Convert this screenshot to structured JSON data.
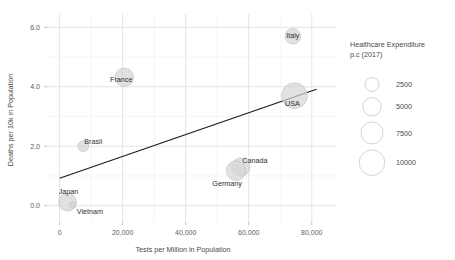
{
  "chart_data": {
    "type": "scatter",
    "title": "",
    "xlabel": "Tests per Million in Population",
    "ylabel": "Deaths per 10k in Population",
    "xlim": [
      -4000,
      88000
    ],
    "ylim": [
      -0.55,
      6.45
    ],
    "xticks": [
      0,
      20000,
      40000,
      60000,
      80000
    ],
    "xticklabels": [
      "0",
      "20,000",
      "40,000",
      "60,000",
      "80,000"
    ],
    "yticks": [
      0.0,
      2.0,
      4.0,
      6.0
    ],
    "yticklabels": [
      "0.0",
      "2.0",
      "4.0",
      "6.0"
    ],
    "grid": true,
    "grid_minor": true,
    "size_variable": "Healthcare Expenditure p.c (2017)",
    "points": [
      {
        "label": "Italy",
        "x": 74000,
        "y": 5.7,
        "size": 3400,
        "label_dx": 0,
        "label_dy": -0.5
      },
      {
        "label": "USA",
        "x": 74500,
        "y": 3.7,
        "size": 10200,
        "label_dx": -2,
        "label_dy": 7.5
      },
      {
        "label": "France",
        "x": 20500,
        "y": 4.32,
        "size": 5100,
        "label_dx": -3,
        "label_dy": 2.0
      },
      {
        "label": "Brasil",
        "x": 7500,
        "y": 2.0,
        "size": 1500,
        "label_dx": 10,
        "label_dy": -5.0
      },
      {
        "label": "Canada",
        "x": 57500,
        "y": 1.3,
        "size": 5000,
        "label_dx": 14,
        "label_dy": -6.0
      },
      {
        "label": "Germany",
        "x": 56000,
        "y": 1.18,
        "size": 5900,
        "label_dx": -9,
        "label_dy": 13.0
      },
      {
        "label": "Japan",
        "x": 2500,
        "y": 0.12,
        "size": 4700,
        "label_dx": 1,
        "label_dy": -10.0
      },
      {
        "label": "Vietnam",
        "x": 4200,
        "y": 0.02,
        "size": 500,
        "label_dx": 17,
        "label_dy": 7.0
      }
    ],
    "trendline": {
      "x_start": 0,
      "y_start": 0.92,
      "x_end": 81500,
      "y_end": 3.92
    },
    "legend": {
      "title_line1": "Healthcare Expenditure",
      "title_line2": "p.c (2017)",
      "position": "right",
      "entries": [
        {
          "value": "2500",
          "radius": 7.0
        },
        {
          "value": "5000",
          "radius": 9.2
        },
        {
          "value": "7500",
          "radius": 11.0
        },
        {
          "value": "10000",
          "radius": 12.8
        }
      ]
    },
    "colors": {
      "background": "#ffffff",
      "bubble_fill": "#d6d6d6",
      "bubble_stroke": "#bdbdbd",
      "trendline": "#1a1a1a",
      "gridline_major": "#d9d9d9",
      "gridline_minor": "#ebebeb",
      "text": "#4a4a4a"
    }
  }
}
